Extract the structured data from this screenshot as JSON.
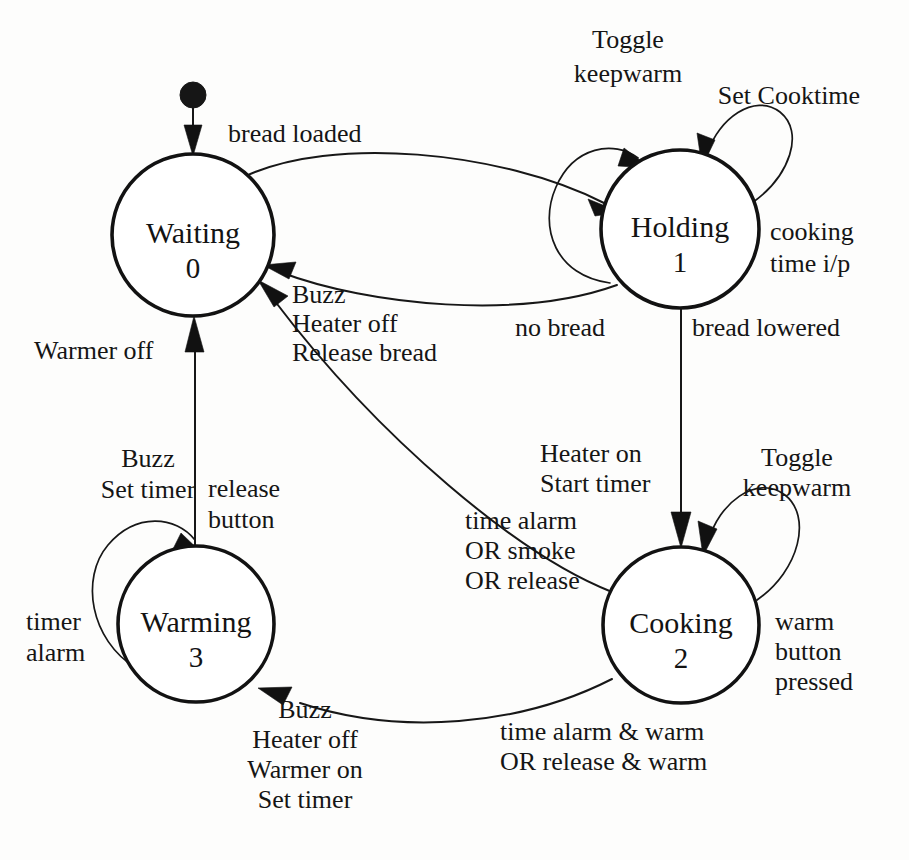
{
  "diagram": {
    "type": "state-machine",
    "initial_state": "Waiting",
    "states": [
      {
        "id": "waiting",
        "name": "Waiting",
        "number": "0",
        "cx": 193,
        "cy": 235,
        "r": 81
      },
      {
        "id": "holding",
        "name": "Holding",
        "number": "1",
        "cx": 680,
        "cy": 229,
        "r": 79
      },
      {
        "id": "warming",
        "name": "Warming",
        "number": "3",
        "cx": 196,
        "cy": 624,
        "r": 78
      },
      {
        "id": "cooking",
        "name": "Cooking",
        "number": "2",
        "cx": 681,
        "cy": 625,
        "r": 78
      }
    ],
    "transitions": [
      {
        "id": "start-to-waiting",
        "from": "(initial)",
        "to": "Waiting",
        "guard": "",
        "actions": []
      },
      {
        "id": "waiting-to-holding",
        "from": "Waiting",
        "to": "Holding",
        "guard": "bread loaded",
        "actions": []
      },
      {
        "id": "holding-self-left",
        "from": "Holding",
        "to": "Holding",
        "guard": "",
        "actions": [
          "Toggle",
          "keepwarm"
        ]
      },
      {
        "id": "holding-self-right",
        "from": "Holding",
        "to": "Holding",
        "guard": "cooking time i/p",
        "actions": [
          "Set Cooktime"
        ],
        "guard_lines": [
          "cooking",
          "time i/p"
        ]
      },
      {
        "id": "holding-to-waiting",
        "from": "Holding",
        "to": "Waiting",
        "guard": "no bread",
        "actions": []
      },
      {
        "id": "holding-to-cooking",
        "from": "Holding",
        "to": "Cooking",
        "guard": "bread lowered",
        "actions": [
          "Heater on",
          "Start timer"
        ]
      },
      {
        "id": "cooking-self-right",
        "from": "Cooking",
        "to": "Cooking",
        "guard": "warm button pressed",
        "actions": [
          "Toggle",
          "keepwarm"
        ],
        "guard_lines": [
          "warm",
          "button",
          "pressed"
        ]
      },
      {
        "id": "cooking-to-waiting",
        "from": "Cooking",
        "to": "Waiting",
        "guard": "time alarm OR smoke OR release",
        "actions": [
          "Buzz",
          "Heater off",
          "Release bread"
        ],
        "guard_lines": [
          "time alarm",
          "OR smoke",
          "OR release"
        ]
      },
      {
        "id": "cooking-to-warming",
        "from": "Cooking",
        "to": "Warming",
        "guard": "time alarm & warm OR release & warm",
        "actions": [
          "Buzz",
          "Heater off",
          "Warmer on",
          "Set timer"
        ],
        "guard_lines": [
          "time alarm & warm",
          "OR release & warm"
        ]
      },
      {
        "id": "warming-self-left",
        "from": "Warming",
        "to": "Warming",
        "guard": "timer alarm",
        "actions": [
          "Buzz",
          "Set timer"
        ],
        "guard_lines": [
          "timer",
          "alarm"
        ]
      },
      {
        "id": "warming-to-waiting",
        "from": "Warming",
        "to": "Waiting",
        "guard": "release button",
        "actions": [
          "Warmer off"
        ],
        "guard_lines": [
          "release",
          "button"
        ]
      }
    ],
    "labels": {
      "bread_loaded": "bread loaded",
      "toggle": "Toggle",
      "keepwarm": "keepwarm",
      "set_cooktime": "Set Cooktime",
      "cooking": "cooking",
      "time_ip": "time i/p",
      "no_bread": "no bread",
      "bread_lowered": "bread lowered",
      "buzz": "Buzz",
      "heater_off": "Heater off",
      "release_bread": "Release bread",
      "warmer_off": "Warmer off",
      "buzz2": "Buzz",
      "set_timer": "Set timer",
      "release": "release",
      "button": "button",
      "timer": "timer",
      "alarm": "alarm",
      "heater_on": "Heater on",
      "start_timer": "Start timer",
      "time_alarm": "time alarm",
      "or_smoke": "OR smoke",
      "or_release": "OR release",
      "toggle2": "Toggle",
      "keepwarm2": "keepwarm",
      "warm": "warm",
      "button2": "button",
      "pressed": "pressed",
      "buzz3": "Buzz",
      "heater_off2": "Heater off",
      "warmer_on": "Warmer on",
      "set_timer2": "Set timer",
      "time_alarm_warm": "time alarm & warm",
      "or_release_warm": "OR release & warm"
    },
    "states_text": {
      "waiting_name": "Waiting",
      "waiting_num": "0",
      "holding_name": "Holding",
      "holding_num": "1",
      "warming_name": "Warming",
      "warming_num": "3",
      "cooking_name": "Cooking",
      "cooking_num": "2"
    },
    "colors": {
      "stroke": "#131313",
      "fill": "#ffffff",
      "background": "#fdfdfc"
    }
  }
}
